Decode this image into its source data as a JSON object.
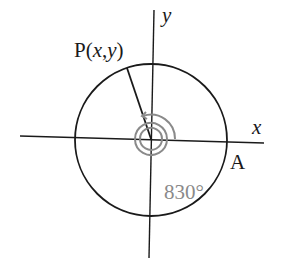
{
  "diagram": {
    "labels": {
      "point_p_prefix": "P(",
      "point_p_x": "x",
      "point_p_sep": ",",
      "point_p_y": "y",
      "point_p_suffix": ")",
      "y_axis": "y",
      "x_axis": "x",
      "point_a": "A",
      "angle": "830°"
    },
    "colors": {
      "stroke": "#1a1a1a",
      "spiral": "#8a8a8a",
      "angle_label": "#8a8a8a",
      "background": "#ffffff"
    },
    "geometry": {
      "center": [
        151,
        139
      ],
      "radius": 76,
      "point_p": [
        127,
        68
      ],
      "point_a": [
        226,
        141
      ]
    }
  }
}
